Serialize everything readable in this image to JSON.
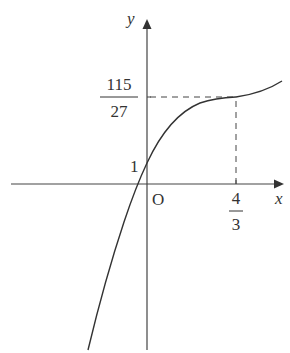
{
  "figure": {
    "type": "function-graph",
    "colors": {
      "background": "#ffffff",
      "axis": "#444444",
      "curve": "#333333",
      "dashed": "#444444",
      "text": "#333333"
    },
    "axes": {
      "x_label": "x",
      "y_label": "y",
      "origin_label": "O"
    },
    "labels": {
      "y_intercept": "1",
      "y_mark_numerator": "115",
      "y_mark_denominator": "27",
      "x_mark_numerator": "4",
      "x_mark_denominator": "3"
    },
    "key_points": [
      {
        "name": "y-intercept",
        "x": "0",
        "y": "1"
      },
      {
        "name": "inflection-point",
        "x": "4/3",
        "y": "115/27"
      }
    ]
  }
}
